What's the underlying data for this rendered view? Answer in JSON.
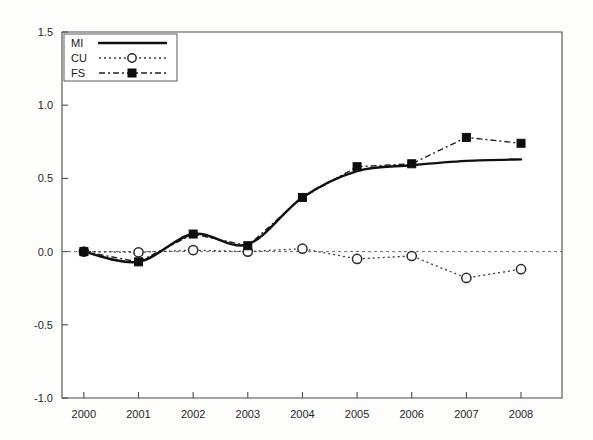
{
  "chart_data": {
    "type": "line",
    "title": "",
    "subtitle": "",
    "xlabel": "",
    "ylabel": "",
    "categories": [
      "2000",
      "2001",
      "2002",
      "2003",
      "2004",
      "2005",
      "2006",
      "2007",
      "2008"
    ],
    "x": [
      2000,
      2001,
      2002,
      2003,
      2004,
      2005,
      2006,
      2007,
      2008
    ],
    "xlim": [
      1999.6,
      2008.75
    ],
    "ylim": [
      -1.0,
      1.5
    ],
    "yticks": [
      -1.0,
      -0.5,
      0.0,
      0.5,
      1.0,
      1.5
    ],
    "ytick_labels": [
      "-1.0",
      "-0.5",
      "0.0",
      "0.5",
      "1.0",
      "1.5"
    ],
    "xticks": [
      2000,
      2001,
      2002,
      2003,
      2004,
      2005,
      2006,
      2007,
      2008
    ],
    "xtick_labels": [
      "2000",
      "2001",
      "2002",
      "2003",
      "2004",
      "2005",
      "2006",
      "2007",
      "2008"
    ],
    "grid": false,
    "zero_reference_line": 0.0,
    "legend_position": "top-left",
    "series": [
      {
        "name": "MI",
        "line_style": "solid",
        "marker": "none",
        "smoothed": true,
        "color": "#101010",
        "values": [
          0.0,
          -0.07,
          0.12,
          0.05,
          0.37,
          0.55,
          0.59,
          0.62,
          0.63
        ]
      },
      {
        "name": "CU",
        "line_style": "dotted",
        "marker": "open-circle",
        "smoothed": false,
        "color": "#3a3a3a",
        "values": [
          0.0,
          -0.005,
          0.01,
          0.0,
          0.02,
          -0.05,
          -0.03,
          -0.18,
          -0.12
        ]
      },
      {
        "name": "FS",
        "line_style": "dash-dot",
        "marker": "filled-square",
        "smoothed": false,
        "color": "#202020",
        "values": [
          0.0,
          -0.07,
          0.12,
          0.04,
          0.37,
          0.58,
          0.6,
          0.78,
          0.74
        ]
      }
    ]
  },
  "legend": {
    "entries": [
      {
        "label": "MI"
      },
      {
        "label": "CU"
      },
      {
        "label": "FS"
      }
    ]
  }
}
